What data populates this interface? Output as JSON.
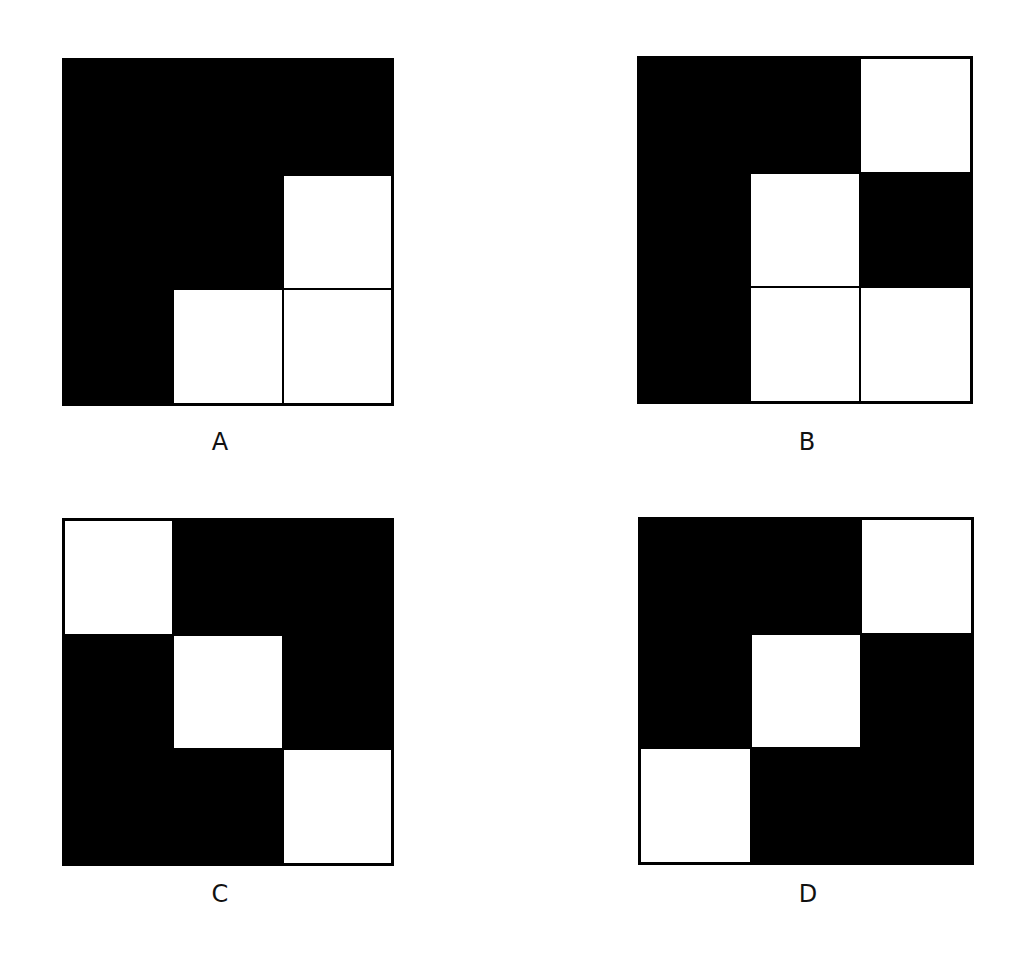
{
  "figure": {
    "panels": [
      {
        "id": "A",
        "label": "A",
        "cells": [
          "b",
          "b",
          "b",
          "b",
          "b",
          "w",
          "b",
          "w",
          "w"
        ]
      },
      {
        "id": "B",
        "label": "B",
        "cells": [
          "b",
          "b",
          "w",
          "b",
          "w",
          "b",
          "b",
          "w",
          "w"
        ]
      },
      {
        "id": "C",
        "label": "C",
        "cells": [
          "w",
          "b",
          "b",
          "b",
          "w",
          "b",
          "b",
          "b",
          "w"
        ]
      },
      {
        "id": "D",
        "label": "D",
        "cells": [
          "b",
          "b",
          "w",
          "b",
          "w",
          "b",
          "w",
          "b",
          "b"
        ]
      }
    ],
    "colors": {
      "filled": "#000000",
      "empty": "#ffffff",
      "border": "#000000"
    }
  }
}
